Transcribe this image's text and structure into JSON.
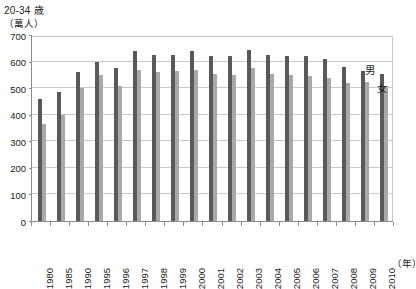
{
  "header": {
    "title": "20-34 歳",
    "unit_label": "（萬人）"
  },
  "axis": {
    "x_unit": "（年）",
    "y_ticks": [
      "0",
      "100",
      "200",
      "300",
      "400",
      "500",
      "600",
      "700"
    ]
  },
  "legend": {
    "male_label": "男",
    "female_label": "女"
  },
  "colors": {
    "male": "#595959",
    "female": "#a9a9a9",
    "grid": "#c9c9c9",
    "axis": "#8c8c8c",
    "background": "#ffffff"
  },
  "chart_data": {
    "type": "bar",
    "title": "20-34 歳",
    "xlabel": "（年）",
    "ylabel": "（萬人）",
    "ylim": [
      0,
      700
    ],
    "ytick_step": 100,
    "grid": true,
    "legend_position": "inside-right",
    "categories": [
      "1980",
      "1985",
      "1990",
      "1995",
      "1996",
      "1997",
      "1998",
      "1999",
      "2000",
      "2001",
      "2002",
      "2003",
      "2004",
      "2005",
      "2006",
      "2007",
      "2008",
      "2009",
      "2010"
    ],
    "series": [
      {
        "name": "男",
        "color": "#595959",
        "values": [
          460,
          485,
          560,
          600,
          575,
          640,
          625,
          625,
          640,
          620,
          620,
          645,
          625,
          620,
          620,
          610,
          580,
          565,
          555
        ]
      },
      {
        "name": "女",
        "color": "#a9a9a9",
        "values": [
          365,
          400,
          500,
          550,
          510,
          570,
          560,
          565,
          570,
          555,
          550,
          575,
          555,
          550,
          545,
          540,
          520,
          525,
          510
        ]
      }
    ]
  }
}
